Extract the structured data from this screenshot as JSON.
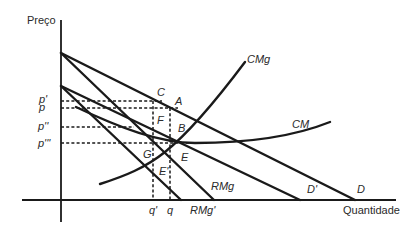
{
  "axes": {
    "y_label": "Preço",
    "x_label": "Quantidade"
  },
  "price_labels": {
    "p_prime": "p'",
    "p": "p",
    "p_double": "p''",
    "p_triple": "p'''"
  },
  "quantity_labels": {
    "q_prime": "q'",
    "q": "q"
  },
  "curve_labels": {
    "cmg": "CMg",
    "cm": "CM",
    "rmg": "RMg",
    "rmg_prime": "RMg'",
    "d": "D",
    "d_prime": "D'"
  },
  "point_labels": {
    "a": "A",
    "b": "B",
    "c": "C",
    "e": "E",
    "e_prime": "E'",
    "f": "F",
    "g": "G"
  },
  "colors": {
    "ink": "#1a1a1a",
    "background": "#ffffff"
  }
}
